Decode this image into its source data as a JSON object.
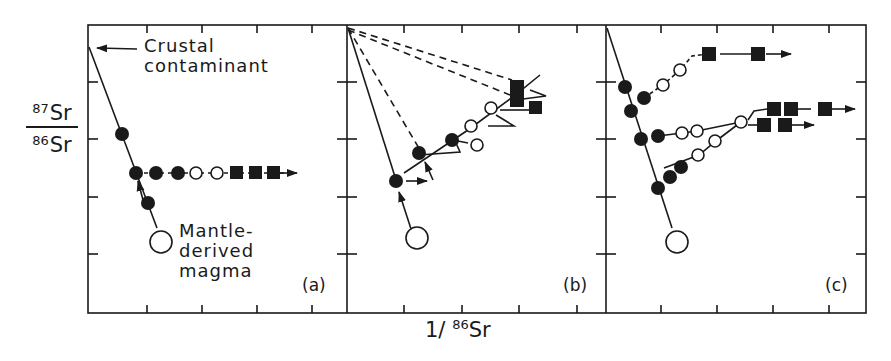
{
  "figure": {
    "y_axis_label": {
      "numerator_mass": "87",
      "numerator_el": "Sr",
      "denominator_mass": "86",
      "denominator_el": "Sr"
    },
    "x_axis_label": {
      "prefix": "1/ ",
      "mass": "86",
      "el": "Sr"
    },
    "panels": [
      {
        "id": "a",
        "label": "(a)"
      },
      {
        "id": "b",
        "label": "(b)"
      },
      {
        "id": "c",
        "label": "(c)"
      }
    ],
    "annotations": {
      "crustal_line1": "Crustal",
      "crustal_line2": "contaminant",
      "mantle_line1": "Mantle-",
      "mantle_line2": "derived",
      "mantle_line3": "magma"
    },
    "symbols_legend": {
      "filled_circle": "contaminated magma (AFC stage)",
      "open_circle": "fractionating magma",
      "filled_square": "late differentiates",
      "large_open_circle": "mantle-derived magma",
      "apex": "crustal contaminant"
    },
    "colors": {
      "ink": "#1a1a1a",
      "background": "#ffffff"
    }
  }
}
